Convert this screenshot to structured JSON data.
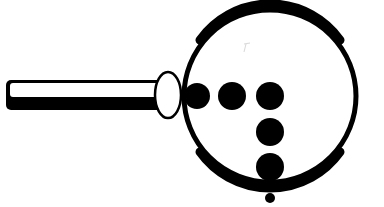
{
  "illustration": {
    "subject": "magnifying-glass-icon",
    "description": "Magnifying glass with dots arranged in a T/corner pattern inside the lens",
    "colors": {
      "background": "#ffffff",
      "ink": "#000000"
    },
    "handle": {
      "x": 6,
      "y": 80,
      "width": 156,
      "height": 30
    },
    "ferrule": {
      "cx": 168,
      "cy": 95,
      "rx": 13,
      "ry": 23
    },
    "lens": {
      "cx": 270,
      "cy": 96,
      "r": 87,
      "stroke_width": 6
    },
    "dots": [
      {
        "cx": 197,
        "cy": 96,
        "r": 13
      },
      {
        "cx": 232,
        "cy": 96,
        "r": 14
      },
      {
        "cx": 270,
        "cy": 96,
        "r": 14
      },
      {
        "cx": 270,
        "cy": 132,
        "r": 14
      },
      {
        "cx": 270,
        "cy": 168,
        "r": 14
      },
      {
        "cx": 270,
        "cy": 198,
        "r": 5
      }
    ]
  }
}
